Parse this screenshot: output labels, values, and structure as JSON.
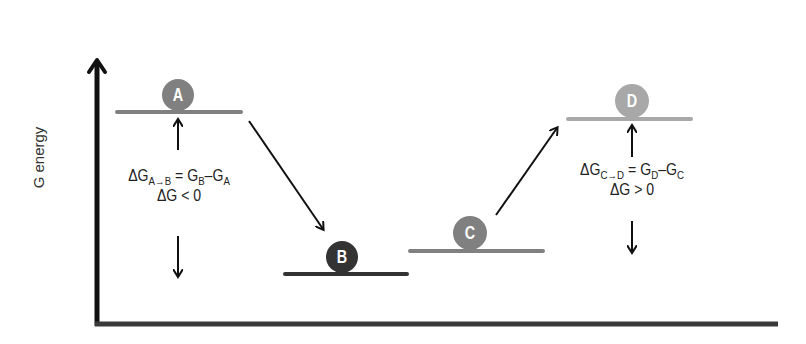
{
  "diagram": {
    "y_axis_label": "G energy",
    "colors": {
      "axis": "#111111",
      "x_axis": "#333333",
      "arrow": "#111111",
      "state_A": "#808080",
      "state_B": "#333333",
      "state_C": "#808080",
      "state_D": "#a8a8a8",
      "label_text": "#ffffff"
    },
    "states": [
      {
        "id": "A",
        "label": "A",
        "level_y": 112,
        "x1": 117,
        "x2": 241,
        "circle_cx": 178,
        "color": "#808080"
      },
      {
        "id": "B",
        "label": "B",
        "level_y": 274,
        "x1": 285,
        "x2": 407,
        "circle_cx": 342,
        "color": "#333333"
      },
      {
        "id": "C",
        "label": "C",
        "level_y": 251,
        "x1": 410,
        "x2": 543,
        "circle_cx": 470,
        "color": "#808080"
      },
      {
        "id": "D",
        "label": "D",
        "level_y": 119,
        "x1": 568,
        "x2": 691,
        "circle_cx": 632,
        "color": "#a8a8a8"
      }
    ],
    "transitions": [
      {
        "from": "A",
        "to": "B",
        "direction": "down"
      },
      {
        "from": "C",
        "to": "D",
        "direction": "up"
      }
    ],
    "annotations": {
      "left": {
        "delta": "ΔG",
        "sub_from": "A",
        "sub_arrow": "→",
        "sub_to": "B",
        "equals": "=",
        "g_final": "G",
        "g_final_sub": "B",
        "minus": "–",
        "g_initial": "G",
        "g_initial_sub": "A",
        "condition": "ΔG < 0"
      },
      "right": {
        "delta": "ΔG",
        "sub_from": "C",
        "sub_arrow": "→",
        "sub_to": "D",
        "equals": "=",
        "g_final": "G",
        "g_final_sub": "D",
        "minus": "–",
        "g_initial": "G",
        "g_initial_sub": "C",
        "condition": "ΔG > 0"
      }
    }
  }
}
